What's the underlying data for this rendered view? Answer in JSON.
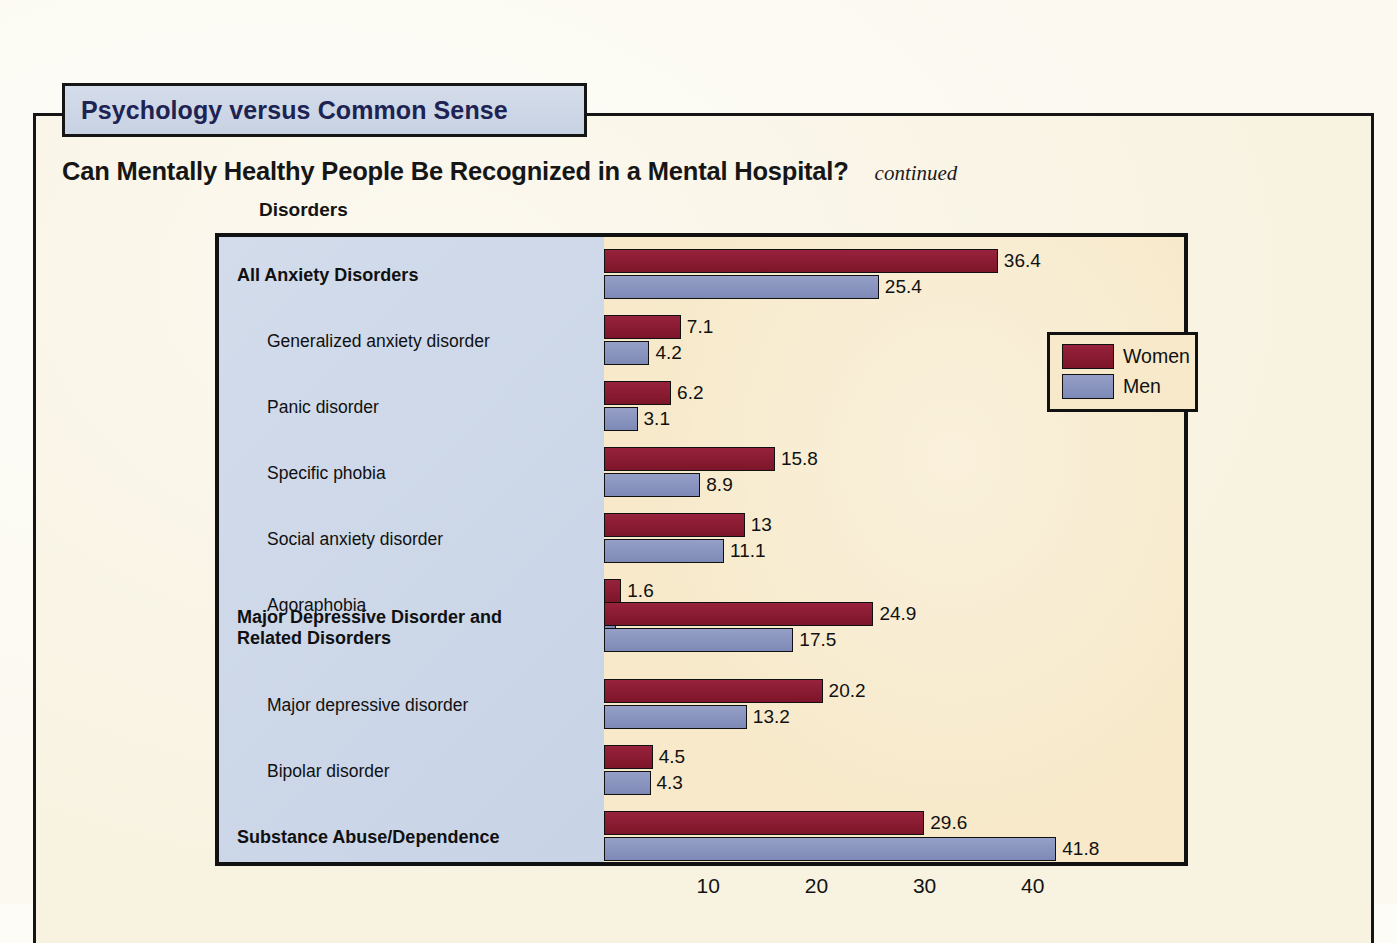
{
  "tab": {
    "label": "Psychology versus Common Sense"
  },
  "heading": {
    "title": "Can Mentally Healthy People Be Recognized in a Mental Hospital?",
    "continued": "continued"
  },
  "column_header": "Disorders",
  "legend": {
    "items": [
      {
        "label": "Women",
        "color": "#8d1b34"
      },
      {
        "label": "Men",
        "color": "#8a95c0"
      }
    ]
  },
  "colors": {
    "tab_fill": "#ccd5e5",
    "tab_text": "#1d2352",
    "label_panel": "#ccd7e8",
    "plot_panel": "#f7e9c9",
    "page": "#f8f2e0",
    "women": "#8d1b34",
    "men": "#8a95c0"
  },
  "chart_data": {
    "type": "bar",
    "orientation": "horizontal",
    "title": "Can Mentally Healthy People Be Recognized in a Mental Hospital?",
    "xlabel": "",
    "ylabel": "Disorders",
    "xlim": [
      0,
      45
    ],
    "xticks": [
      10,
      20,
      30,
      40
    ],
    "xtick_labels": [
      "10",
      "20",
      "30",
      "40"
    ],
    "grid": false,
    "legend_position": "upper right",
    "categories": [
      "All Anxiety Disorders",
      "Generalized anxiety disorder",
      "Panic disorder",
      "Specific phobia",
      "Social anxiety disorder",
      "Agoraphobia",
      "Major Depressive Disorder and Related Disorders",
      "Major depressive disorder",
      "Bipolar disorder",
      "Substance Abuse/Dependence"
    ],
    "category_levels": [
      "major",
      "sub",
      "sub",
      "sub",
      "sub",
      "sub",
      "major",
      "sub",
      "sub",
      "major"
    ],
    "series": [
      {
        "name": "Women",
        "color": "#8d1b34",
        "values": [
          36.4,
          7.1,
          6.2,
          15.8,
          13,
          1.6,
          24.9,
          20.2,
          4.5,
          29.6
        ],
        "value_labels": [
          "36.4",
          "7.1",
          "6.2",
          "15.8",
          "13",
          "1.6",
          "24.9",
          "20.2",
          "4.5",
          "29.6"
        ]
      },
      {
        "name": "Men",
        "color": "#8a95c0",
        "values": [
          25.4,
          4.2,
          3.1,
          8.9,
          11.1,
          1.1,
          17.5,
          13.2,
          4.3,
          41.8
        ],
        "value_labels": [
          "25.4",
          "4.2",
          "3.1",
          "8.9",
          "11.1",
          "1.1",
          "17.5",
          "13.2",
          "4.3",
          "41.8"
        ]
      }
    ]
  },
  "rows": [
    {
      "label": "All Anxiety Disorders",
      "label2": "",
      "level": "major",
      "top": 10,
      "women": 36.4,
      "men": 25.4,
      "wlabel": "36.4",
      "mlabel": "25.4"
    },
    {
      "label": "Generalized anxiety disorder",
      "label2": "",
      "level": "sub",
      "top": 76,
      "women": 7.1,
      "men": 4.2,
      "wlabel": "7.1",
      "mlabel": "4.2"
    },
    {
      "label": "Panic disorder",
      "label2": "",
      "level": "sub",
      "top": 142,
      "women": 6.2,
      "men": 3.1,
      "wlabel": "6.2",
      "mlabel": "3.1"
    },
    {
      "label": "Specific phobia",
      "label2": "",
      "level": "sub",
      "top": 208,
      "women": 15.8,
      "men": 8.9,
      "wlabel": "15.8",
      "mlabel": "8.9"
    },
    {
      "label": "Social anxiety disorder",
      "label2": "",
      "level": "sub",
      "top": 274,
      "women": 13,
      "men": 11.1,
      "wlabel": "13",
      "mlabel": "11.1"
    },
    {
      "label": "Agoraphobia",
      "label2": "",
      "level": "sub",
      "top": 340,
      "women": 1.6,
      "men": 1.1,
      "wlabel": "1.6",
      "mlabel": "1.1"
    },
    {
      "label": "Major Depressive Disorder and",
      "label2": "Related Disorders",
      "level": "major",
      "top": 363,
      "women": 24.9,
      "men": 17.5,
      "wlabel": "24.9",
      "mlabel": "17.5"
    },
    {
      "label": "Major depressive disorder",
      "label2": "",
      "level": "sub",
      "top": 440,
      "women": 20.2,
      "men": 13.2,
      "wlabel": "20.2",
      "mlabel": "13.2"
    },
    {
      "label": "Bipolar disorder",
      "label2": "",
      "level": "sub",
      "top": 506,
      "women": 4.5,
      "men": 4.3,
      "wlabel": "4.5",
      "mlabel": "4.3"
    },
    {
      "label": "Substance Abuse/Dependence",
      "label2": "",
      "level": "major",
      "top": 572,
      "women": 29.6,
      "men": 41.8,
      "wlabel": "29.6",
      "mlabel": "41.8"
    }
  ],
  "axis": {
    "ticks": [
      {
        "label": "10",
        "value": 10
      },
      {
        "label": "20",
        "value": 20
      },
      {
        "label": "30",
        "value": 30
      },
      {
        "label": "40",
        "value": 40
      }
    ]
  }
}
